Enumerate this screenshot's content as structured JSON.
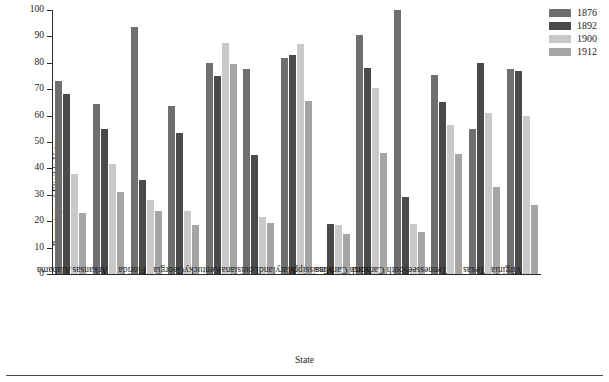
{
  "chart_data": {
    "type": "bar",
    "title": "",
    "xlabel": "State",
    "ylabel": "Percentage of Eligible Voters",
    "ylim": [
      0,
      100
    ],
    "ytick_step": 10,
    "yticks": [
      0,
      10,
      20,
      30,
      40,
      50,
      60,
      70,
      80,
      90,
      100
    ],
    "grid": false,
    "legend_position": "top-right",
    "categories": [
      "Alabama",
      "Arkansas",
      "Florida",
      "Georgia",
      "Kentucky",
      "Louisiana",
      "Maryland",
      "Mississippi",
      "North Carolina",
      "South Carolina",
      "Tennessee",
      "Texas",
      "Virginia"
    ],
    "series": [
      {
        "name": "1876",
        "color": "#6f6f6f",
        "values": [
          73,
          64.5,
          93.5,
          63.5,
          80,
          77.5,
          82,
          null,
          90.5,
          100,
          75.5,
          55,
          77.5
        ]
      },
      {
        "name": "1892",
        "color": "#4a4a4a",
        "values": [
          68,
          55,
          35.5,
          53.5,
          75,
          45,
          83,
          19,
          78,
          29,
          65,
          80,
          77
        ]
      },
      {
        "name": "1900",
        "color": "#c9c9c9",
        "values": [
          38,
          41.5,
          28,
          24,
          87.5,
          21.5,
          87,
          18.5,
          70.5,
          19,
          56.5,
          61,
          60
        ]
      },
      {
        "name": "1912",
        "color": "#a5a5a5",
        "values": [
          23,
          31,
          24,
          18.5,
          79.5,
          19.5,
          65.5,
          15,
          46,
          16,
          45.5,
          33,
          26
        ]
      }
    ]
  },
  "legend": {
    "items": [
      {
        "label": "1876",
        "color": "#6f6f6f"
      },
      {
        "label": "1892",
        "color": "#4a4a4a"
      },
      {
        "label": "1900",
        "color": "#c9c9c9"
      },
      {
        "label": "1912",
        "color": "#a5a5a5"
      }
    ]
  },
  "axes": {
    "y_title": "Percentage of Eligible Voters",
    "x_title": "State",
    "y_ticks": [
      "100",
      "90",
      "80",
      "70",
      "60",
      "50",
      "40",
      "30",
      "20",
      "10",
      "0"
    ]
  }
}
